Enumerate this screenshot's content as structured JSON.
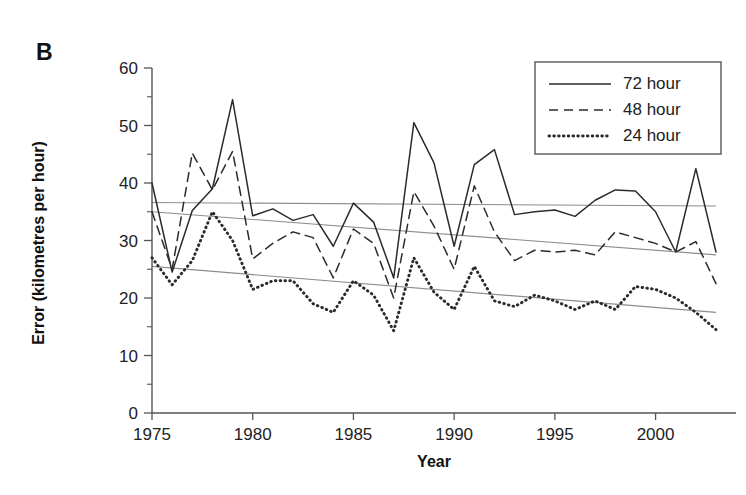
{
  "figure": {
    "panel_letter": "B",
    "background_color": "#ffffff",
    "line_color": "#2b2b2b",
    "trend_color": "#8d8d8d",
    "axis_color": "#555555"
  },
  "legend": {
    "position": "top-right",
    "items": [
      {
        "label": "72 hour",
        "style": "solid"
      },
      {
        "label": "48 hour",
        "style": "dashed"
      },
      {
        "label": "24 hour",
        "style": "dotted"
      }
    ]
  },
  "chart_data": {
    "type": "line",
    "title": "",
    "xlabel": "Year",
    "ylabel": "Error (kilometres per hour)",
    "xlim": [
      1975,
      2003
    ],
    "ylim": [
      0,
      60
    ],
    "xticks": [
      1975,
      1980,
      1985,
      1990,
      1995,
      2000
    ],
    "xtick_labels": [
      "1975",
      "1980",
      "1985",
      "1990",
      "1995",
      "2000"
    ],
    "yticks": [
      0,
      10,
      20,
      30,
      40,
      50,
      60
    ],
    "ytick_labels": [
      "0",
      "10",
      "20",
      "30",
      "40",
      "50",
      "60"
    ],
    "y_minor_ticks": [
      5,
      15,
      25,
      35,
      45,
      55
    ],
    "grid": false,
    "x": [
      1975,
      1976,
      1977,
      1978,
      1979,
      1980,
      1981,
      1982,
      1983,
      1984,
      1985,
      1986,
      1987,
      1988,
      1989,
      1990,
      1991,
      1992,
      1993,
      1994,
      1995,
      1996,
      1997,
      1998,
      1999,
      2000,
      2001,
      2002,
      2003
    ],
    "series": [
      {
        "name": "72 hour",
        "style": "solid",
        "values": [
          40.0,
          24.5,
          35.2,
          39.0,
          54.5,
          34.3,
          35.5,
          33.5,
          34.5,
          29.0,
          36.5,
          33.2,
          23.5,
          50.5,
          43.5,
          29.0,
          43.2,
          45.8,
          34.5,
          35.0,
          35.3,
          34.2,
          37.0,
          38.8,
          38.6,
          35.0,
          28.0,
          42.5,
          28.0
        ]
      },
      {
        "name": "48 hour",
        "style": "dashed",
        "values": [
          35.0,
          25.0,
          45.2,
          38.8,
          45.5,
          26.8,
          29.5,
          31.5,
          30.5,
          23.5,
          32.0,
          29.5,
          20.0,
          38.5,
          32.5,
          25.0,
          39.5,
          31.5,
          26.5,
          28.3,
          28.0,
          28.3,
          27.5,
          31.5,
          30.5,
          29.5,
          28.0,
          29.8,
          22.5
        ]
      },
      {
        "name": "24 hour",
        "style": "dotted",
        "values": [
          27.0,
          22.3,
          26.5,
          35.0,
          30.0,
          21.5,
          23.0,
          23.0,
          19.0,
          17.5,
          23.0,
          20.5,
          14.3,
          27.0,
          21.0,
          18.0,
          25.5,
          19.5,
          18.5,
          20.5,
          19.5,
          18.0,
          19.5,
          18.0,
          22.0,
          21.5,
          20.0,
          17.5,
          14.5
        ]
      }
    ],
    "trend_lines": [
      {
        "name": "72 hour trend",
        "y_start": 36.6,
        "y_end": 36.0
      },
      {
        "name": "48 hour trend",
        "y_start": 35.0,
        "y_end": 27.5
      },
      {
        "name": "24 hour trend",
        "y_start": 25.5,
        "y_end": 17.5
      }
    ]
  }
}
